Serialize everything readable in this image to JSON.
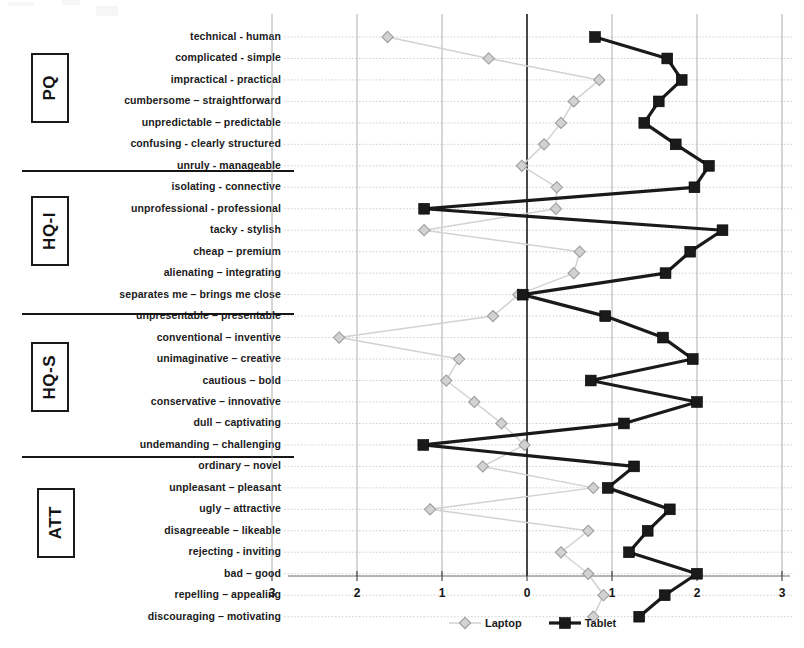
{
  "chart_data": {
    "type": "line",
    "orientation": "horizontal",
    "title": "",
    "subtitle": "",
    "xlabel": "",
    "ylabel": "",
    "xlim": [
      -3,
      3
    ],
    "xticks": [
      -3,
      -2,
      -1,
      0,
      1,
      2,
      3
    ],
    "xticklabels": [
      "3",
      "2",
      "1",
      "0",
      "1",
      "2",
      "3"
    ],
    "grid": true,
    "legend_position": "bottom-center",
    "groups": [
      {
        "name": "PQ",
        "label": "PQ",
        "items": 7
      },
      {
        "name": "HQ-I",
        "label": "HQ-I",
        "items": 7
      },
      {
        "name": "HQ-S",
        "label": "HQ-S",
        "items": 7
      },
      {
        "name": "ATT",
        "label": "ATT",
        "items": 7
      }
    ],
    "categories": [
      "technical - human",
      "complicated - simple",
      "impractical - practical",
      "cumbersome – straightforward",
      "unpredictable – predictable",
      "confusing - clearly structured",
      "unruly - manageable",
      "isolating - connective",
      "unprofessional - professional",
      "tacky - stylish",
      "cheap – premium",
      "alienating – integrating",
      "separates me – brings me close",
      "unpresentable – presentable",
      "conventional – inventive",
      "unimaginative – creative",
      "cautious – bold",
      "conservative – innovative",
      "dull – captivating",
      "undemanding – challenging",
      "ordinary – novel",
      "unpleasant – pleasant",
      "ugly – attractive",
      "disagreeable – likeable",
      "rejecting - inviting",
      "bad – good",
      "repelling – appealing",
      "discouraging – motivating"
    ],
    "series": [
      {
        "name": "Laptop",
        "color": "#d2d2d2",
        "marker": "diamond",
        "values": [
          -1.64,
          -0.45,
          0.85,
          0.55,
          0.4,
          0.2,
          -0.06,
          0.35,
          0.34,
          -1.21,
          0.62,
          0.55,
          -0.1,
          -0.4,
          -2.21,
          -0.8,
          -0.95,
          -0.62,
          -0.3,
          -0.03,
          -0.52,
          0.78,
          -1.14,
          0.72,
          0.4,
          0.72,
          0.9,
          0.78
        ]
      },
      {
        "name": "Tablet",
        "color": "#1a1a1a",
        "marker": "square",
        "values": [
          0.8,
          1.65,
          1.82,
          1.55,
          1.38,
          1.75,
          2.14,
          1.97,
          -1.21,
          2.3,
          1.92,
          1.63,
          -0.05,
          0.92,
          1.6,
          1.95,
          0.75,
          2.0,
          1.14,
          -1.22,
          1.26,
          0.95,
          1.68,
          1.42,
          1.2,
          2.0,
          1.62,
          1.32
        ]
      }
    ],
    "legend": [
      {
        "label": "Laptop",
        "color": "#d2d2d2",
        "marker": "diamond"
      },
      {
        "label": "Tablet",
        "color": "#1a1a1a",
        "marker": "square"
      }
    ]
  }
}
